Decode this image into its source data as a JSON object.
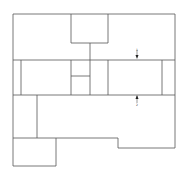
{
  "diagram": {
    "type": "floor-plan",
    "stroke_color": "#555555",
    "background": "#ffffff",
    "walls": [
      {
        "x1": 13,
        "y1": 14,
        "x2": 175,
        "y2": 14
      },
      {
        "x1": 13,
        "y1": 14,
        "x2": 13,
        "y2": 166
      },
      {
        "x1": 175,
        "y1": 14,
        "x2": 175,
        "y2": 148
      },
      {
        "x1": 71,
        "y1": 14,
        "x2": 71,
        "y2": 43
      },
      {
        "x1": 108,
        "y1": 14,
        "x2": 108,
        "y2": 43
      },
      {
        "x1": 71,
        "y1": 43,
        "x2": 108,
        "y2": 43
      },
      {
        "x1": 90,
        "y1": 43,
        "x2": 90,
        "y2": 95
      },
      {
        "x1": 13,
        "y1": 60,
        "x2": 175,
        "y2": 60
      },
      {
        "x1": 13,
        "y1": 95,
        "x2": 175,
        "y2": 95
      },
      {
        "x1": 21,
        "y1": 60,
        "x2": 21,
        "y2": 95
      },
      {
        "x1": 71,
        "y1": 60,
        "x2": 71,
        "y2": 95
      },
      {
        "x1": 71,
        "y1": 76,
        "x2": 90,
        "y2": 76
      },
      {
        "x1": 108,
        "y1": 60,
        "x2": 108,
        "y2": 95
      },
      {
        "x1": 162,
        "y1": 60,
        "x2": 162,
        "y2": 95
      },
      {
        "x1": 37,
        "y1": 95,
        "x2": 37,
        "y2": 138
      },
      {
        "x1": 13,
        "y1": 138,
        "x2": 118,
        "y2": 138
      },
      {
        "x1": 118,
        "y1": 138,
        "x2": 118,
        "y2": 148
      },
      {
        "x1": 118,
        "y1": 148,
        "x2": 175,
        "y2": 148
      },
      {
        "x1": 56,
        "y1": 138,
        "x2": 56,
        "y2": 166
      },
      {
        "x1": 13,
        "y1": 166,
        "x2": 56,
        "y2": 166
      }
    ],
    "section_markers": [
      {
        "label": "1",
        "x": 137,
        "y": 56,
        "direction": "down"
      },
      {
        "label": "2",
        "x": 137,
        "y": 99,
        "direction": "up"
      }
    ]
  }
}
